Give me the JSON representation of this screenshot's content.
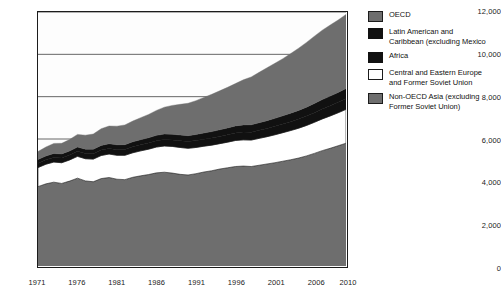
{
  "chart_data": {
    "type": "area",
    "stacked": true,
    "title": "",
    "xlabel": "",
    "ylabel": "",
    "xlim": [
      1971,
      2010
    ],
    "ylim": [
      0,
      12000
    ],
    "ytick_values": [
      0,
      2000,
      4000,
      6000,
      8000,
      10000,
      12000
    ],
    "ytick_labels": [
      "0",
      "2,000",
      "4,000",
      "6,000",
      "8,000",
      "10,000",
      "12,000"
    ],
    "xtick_values": [
      1971,
      1976,
      1981,
      1986,
      1991,
      1996,
      2001,
      2006,
      2010
    ],
    "xtick_labels": [
      "1971",
      "1976",
      "1981",
      "1986",
      "1991",
      "1996",
      "2001",
      "2006",
      "2010"
    ],
    "grid": "horizontal",
    "legend_position": "right",
    "x": [
      1971,
      1972,
      1973,
      1974,
      1975,
      1976,
      1977,
      1978,
      1979,
      1980,
      1981,
      1982,
      1983,
      1984,
      1985,
      1986,
      1987,
      1988,
      1989,
      1990,
      1991,
      1992,
      1993,
      1994,
      1995,
      1996,
      1997,
      1998,
      1999,
      2000,
      2001,
      2002,
      2003,
      2004,
      2005,
      2006,
      2007,
      2008,
      2009,
      2010
    ],
    "stack_order_bottom_to_top": [
      "Non-OECD Asia (excluding Former Soviet Union)",
      "Central and Eastern Europe and Former Soviet Union",
      "Africa",
      "Latin American and Caribbean (excluding Mexico)",
      "OECD"
    ],
    "series": [
      {
        "name": "Non-OECD Asia (excluding Former Soviet Union)",
        "color": "#6e6e6e",
        "values": [
          3750,
          3880,
          3960,
          3900,
          4010,
          4150,
          4020,
          3980,
          4130,
          4180,
          4100,
          4080,
          4190,
          4260,
          4320,
          4400,
          4430,
          4390,
          4330,
          4300,
          4360,
          4440,
          4500,
          4580,
          4640,
          4700,
          4720,
          4700,
          4760,
          4820,
          4880,
          4950,
          5020,
          5100,
          5200,
          5320,
          5450,
          5560,
          5680,
          5800
        ]
      },
      {
        "name": "Central and Eastern Europe and Former Soviet Union",
        "color": "#ffffff",
        "values": [
          900,
          930,
          950,
          980,
          1000,
          1030,
          1050,
          1070,
          1090,
          1110,
          1130,
          1150,
          1160,
          1180,
          1200,
          1220,
          1240,
          1260,
          1270,
          1260,
          1240,
          1220,
          1210,
          1200,
          1210,
          1230,
          1240,
          1250,
          1270,
          1290,
          1320,
          1350,
          1380,
          1410,
          1440,
          1470,
          1500,
          1530,
          1560,
          1600
        ]
      },
      {
        "name": "Africa",
        "color": "#111111",
        "values": [
          210,
          215,
          220,
          228,
          232,
          240,
          246,
          252,
          258,
          262,
          268,
          272,
          278,
          284,
          290,
          296,
          302,
          308,
          314,
          318,
          324,
          330,
          336,
          342,
          350,
          358,
          366,
          374,
          382,
          390,
          400,
          410,
          420,
          432,
          444,
          456,
          468,
          480,
          492,
          505
        ]
      },
      {
        "name": "Latin American and Caribbean (excluding Mexico)",
        "color": "#111111",
        "values": [
          170,
          175,
          182,
          188,
          192,
          198,
          205,
          212,
          218,
          222,
          228,
          232,
          238,
          244,
          250,
          256,
          262,
          268,
          274,
          280,
          288,
          296,
          304,
          312,
          320,
          330,
          340,
          348,
          356,
          366,
          376,
          386,
          396,
          408,
          420,
          432,
          444,
          456,
          468,
          480
        ]
      },
      {
        "name": "OECD",
        "color": "#6e6e6e",
        "values": [
          380,
          420,
          480,
          500,
          540,
          600,
          660,
          720,
          790,
          840,
          880,
          930,
          980,
          1040,
          1100,
          1180,
          1270,
          1360,
          1450,
          1530,
          1600,
          1680,
          1760,
          1840,
          1920,
          2000,
          2130,
          2260,
          2380,
          2500,
          2600,
          2700,
          2820,
          2940,
          3060,
          3180,
          3280,
          3360,
          3420,
          3500
        ]
      }
    ],
    "colors": {
      "oecd": "#6e6e6e",
      "latin_american": "#111111",
      "africa": "#111111",
      "central_eastern_europe": "#ffffff",
      "non_oecd_asia": "#6e6e6e",
      "axis": "#1c1c1c",
      "gridline": "#555555",
      "plot_background": "#fdfdfd"
    }
  },
  "legend": {
    "items": [
      {
        "label": "OECD",
        "color": "#6e6e6e",
        "border": "#1c1c1c"
      },
      {
        "label": "Latin American and\nCaribbean (excluding Mexico",
        "color": "#111111",
        "border": "#111111"
      },
      {
        "label": "Africa",
        "color": "#111111",
        "border": "#111111"
      },
      {
        "label": "Central and Eastern Europe\nand Former Soviet Union",
        "color": "#ffffff",
        "border": "#1c1c1c"
      },
      {
        "label": "Non-OECD Asia (excluding\nFormer Soviet Union)",
        "color": "#6e6e6e",
        "border": "#1c1c1c"
      }
    ]
  }
}
